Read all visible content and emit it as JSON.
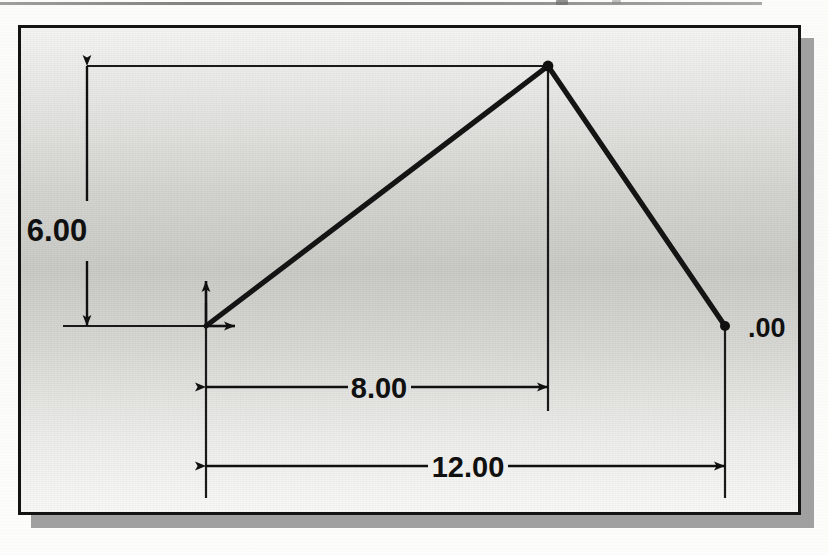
{
  "document": {
    "type": "technical-drawing",
    "description": "CAD dimensioned profile sketch"
  },
  "scan_artifacts": {
    "top_rule": "horizontal-rule",
    "speck_left": "ink-speck",
    "speck_right": "ink-speck"
  },
  "drawing": {
    "frame": {
      "x": 18,
      "y": 25,
      "width": 783,
      "height": 490
    },
    "shadow_offset": {
      "x": 13,
      "y": 13
    },
    "origin_marker": {
      "name": "coordinate-origin",
      "x": 203,
      "y": 323,
      "x_axis_arrow": "right",
      "y_axis_arrow": "up"
    },
    "vertices": [
      {
        "name": "origin-vertex",
        "x": 203,
        "y": 323
      },
      {
        "name": "apex-vertex",
        "x": 545,
        "y": 63
      },
      {
        "name": "right-vertex",
        "x": 722,
        "y": 323
      }
    ],
    "profile_path": "M203,323 L545,63 L722,323",
    "dimensions": [
      {
        "name": "height-dimension",
        "label": "6.00",
        "orientation": "vertical",
        "line_x": 84,
        "from_y": 63,
        "to_y": 323,
        "label_x": 54,
        "label_y": 226,
        "extension_lines": [
          {
            "y": 63,
            "from_x": 84,
            "to_x": 545
          },
          {
            "y": 323,
            "from_x": 84,
            "to_x": 210
          }
        ]
      },
      {
        "name": "apex-offset-dimension",
        "label": "8.00",
        "orientation": "horizontal",
        "line_y": 384,
        "from_x": 203,
        "to_x": 545,
        "label_x": 374,
        "label_y": 393
      },
      {
        "name": "overall-width-dimension",
        "label": "12.00",
        "orientation": "horizontal",
        "line_y": 463,
        "from_x": 203,
        "to_x": 722,
        "label_x": 462,
        "label_y": 472
      },
      {
        "name": "right-vertex-dimension",
        "label": ".00",
        "orientation": "clipped-leader",
        "label_x": 748,
        "label_y": 332
      }
    ],
    "extension_verticals": [
      {
        "name": "origin-extension",
        "x": 203,
        "from_y": 323,
        "to_y": 490
      },
      {
        "name": "apex-extension",
        "x": 545,
        "from_y": 63,
        "to_y": 405
      },
      {
        "name": "right-vertex-extension",
        "x": 722,
        "from_y": 323,
        "to_y": 490
      }
    ]
  },
  "colors": {
    "ink": "#101010",
    "frame_border": "#131313",
    "shadow": "#a0a0a0",
    "paper": "#fdfdfc",
    "canvas_mid": "#c8c8c5"
  }
}
